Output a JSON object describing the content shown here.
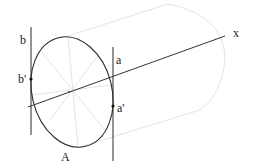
{
  "diagram": {
    "labels": {
      "x_axis": "x",
      "b": "b",
      "b_prime": "b'",
      "a": "a",
      "a_prime": "a'",
      "ellipse": "A"
    },
    "colors": {
      "stroke": "#2a2a2a",
      "faint": "#d6d6d6",
      "background": "#ffffff"
    }
  }
}
